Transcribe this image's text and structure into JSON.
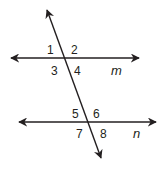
{
  "diagram": {
    "line_color": "#231f20",
    "lines": {
      "m": {
        "label": "m"
      },
      "n": {
        "label": "n"
      }
    },
    "angles": {
      "a1": "1",
      "a2": "2",
      "a3": "3",
      "a4": "4",
      "a5": "5",
      "a6": "6",
      "a7": "7",
      "a8": "8"
    }
  }
}
